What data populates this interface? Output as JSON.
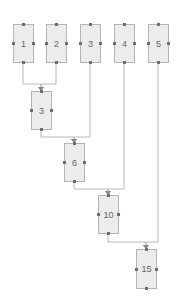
{
  "diagram": {
    "title": "",
    "colors": {
      "node_fill": "#ececec",
      "node_border": "#b4b4b4",
      "edge": "#b8b8b8",
      "port": "#6e6e6e",
      "label": "#666666"
    },
    "nodes": [
      {
        "id": "n1",
        "label": "1",
        "x": 13,
        "y": 24,
        "w": 21,
        "h": 39
      },
      {
        "id": "n2",
        "label": "2",
        "x": 46,
        "y": 24,
        "w": 21,
        "h": 39
      },
      {
        "id": "n3",
        "label": "3",
        "x": 80,
        "y": 24,
        "w": 21,
        "h": 39
      },
      {
        "id": "n4",
        "label": "4",
        "x": 114,
        "y": 24,
        "w": 21,
        "h": 39
      },
      {
        "id": "n5",
        "label": "5",
        "x": 148,
        "y": 24,
        "w": 21,
        "h": 39
      },
      {
        "id": "s3",
        "label": "3",
        "x": 31,
        "y": 91,
        "w": 21,
        "h": 39
      },
      {
        "id": "s6",
        "label": "6",
        "x": 64,
        "y": 143,
        "w": 21,
        "h": 39
      },
      {
        "id": "s10",
        "label": "10",
        "x": 98,
        "y": 195,
        "w": 21,
        "h": 39
      },
      {
        "id": "s15",
        "label": "15",
        "x": 136,
        "y": 249,
        "w": 21,
        "h": 40
      }
    ],
    "edges": [
      {
        "from": "n1",
        "to": "s3",
        "points": [
          [
            23,
            63
          ],
          [
            23,
            84
          ],
          [
            41,
            84
          ],
          [
            41,
            91
          ]
        ]
      },
      {
        "from": "n2",
        "to": "s3",
        "points": [
          [
            56,
            63
          ],
          [
            56,
            84
          ],
          [
            41,
            84
          ],
          [
            41,
            91
          ]
        ]
      },
      {
        "from": "s3",
        "to": "s6",
        "points": [
          [
            41,
            130
          ],
          [
            41,
            137
          ],
          [
            74,
            137
          ],
          [
            74,
            143
          ]
        ]
      },
      {
        "from": "n3",
        "to": "s6",
        "points": [
          [
            90,
            63
          ],
          [
            90,
            137
          ],
          [
            74,
            137
          ],
          [
            74,
            143
          ]
        ]
      },
      {
        "from": "s6",
        "to": "s10",
        "points": [
          [
            74,
            182
          ],
          [
            74,
            189
          ],
          [
            108,
            189
          ],
          [
            108,
            195
          ]
        ]
      },
      {
        "from": "n4",
        "to": "s10",
        "points": [
          [
            124,
            63
          ],
          [
            124,
            189
          ],
          [
            108,
            189
          ],
          [
            108,
            195
          ]
        ]
      },
      {
        "from": "s10",
        "to": "s15",
        "points": [
          [
            108,
            234
          ],
          [
            108,
            242
          ],
          [
            146,
            242
          ],
          [
            146,
            249
          ]
        ]
      },
      {
        "from": "n5",
        "to": "s15",
        "points": [
          [
            158,
            63
          ],
          [
            158,
            242
          ],
          [
            146,
            242
          ],
          [
            146,
            249
          ]
        ]
      }
    ]
  }
}
